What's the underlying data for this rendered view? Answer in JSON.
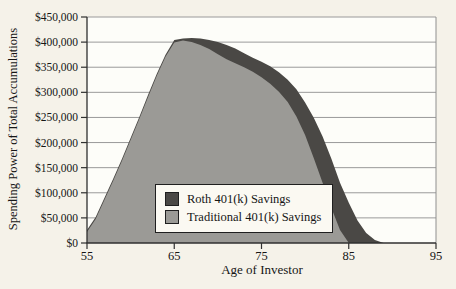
{
  "chart_data": {
    "type": "area",
    "title": "",
    "xlabel": "Age of Investor",
    "ylabel": "Spending Power of Total Accumulations",
    "xlim": [
      55,
      95
    ],
    "ylim": [
      0,
      450000
    ],
    "xticks": [
      55,
      65,
      75,
      85,
      95
    ],
    "xtick_labels": [
      "55",
      "65",
      "75",
      "85",
      "95"
    ],
    "yticks": [
      0,
      50000,
      100000,
      150000,
      200000,
      250000,
      300000,
      350000,
      400000,
      450000
    ],
    "ytick_labels": [
      "$0",
      "$50,000",
      "$100,000",
      "$150,000",
      "$200,000",
      "$250,000",
      "$300,000",
      "$350,000",
      "$400,000",
      "$450,000"
    ],
    "grid": true,
    "legend_position": "inside-bottom-center",
    "colors": {
      "outer_background": "#f5f2e9",
      "plot_background": "#fdfdf9",
      "gridline": "#9a9a9a",
      "axis": "#2f2f2f",
      "plot_border": "#8f8f8f",
      "text": "#161616",
      "legend_background": "#fbf9f2"
    },
    "series": [
      {
        "name": "Roth 401(k) Savings",
        "color": "#4a4845",
        "x": [
          55,
          56,
          57,
          58,
          59,
          60,
          61,
          62,
          63,
          64,
          65,
          66,
          67,
          68,
          69,
          70,
          71,
          72,
          73,
          74,
          75,
          76,
          77,
          78,
          79,
          80,
          81,
          82,
          83,
          84,
          85,
          86,
          87,
          88,
          89
        ],
        "values": [
          26000,
          52000,
          90000,
          128000,
          167000,
          209000,
          251000,
          295000,
          337000,
          375000,
          404000,
          407000,
          408000,
          407000,
          404000,
          400000,
          394000,
          387000,
          378000,
          369000,
          361000,
          352000,
          340000,
          325000,
          306000,
          280000,
          249000,
          212000,
          168000,
          120000,
          80000,
          45000,
          20000,
          6000,
          0
        ]
      },
      {
        "name": "Traditional 401(k) Savings",
        "color": "#9b9a96",
        "x": [
          55,
          56,
          57,
          58,
          59,
          60,
          61,
          62,
          63,
          64,
          65,
          66,
          67,
          68,
          69,
          70,
          71,
          72,
          73,
          74,
          75,
          76,
          77,
          78,
          79,
          80,
          81,
          82,
          83,
          84,
          85
        ],
        "values": [
          22000,
          48000,
          86000,
          124000,
          163000,
          205000,
          247000,
          291000,
          333000,
          371000,
          399000,
          403000,
          400000,
          394000,
          386000,
          376000,
          366000,
          358000,
          350000,
          341000,
          330000,
          317000,
          301000,
          281000,
          252000,
          215000,
          168000,
          120000,
          70000,
          26000,
          0
        ]
      }
    ]
  }
}
